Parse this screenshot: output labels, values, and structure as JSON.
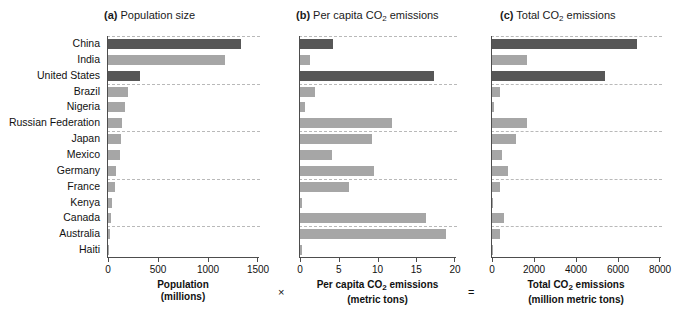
{
  "figure": {
    "operators": {
      "multiply": "×",
      "equals": "="
    }
  },
  "panels": [
    {
      "tag": "(a)",
      "title_text": "Population size",
      "title_html": "Population size",
      "caption_line1": "Population",
      "caption_line2": "(millions)",
      "ticks": [
        0,
        500,
        1000,
        1500
      ],
      "tick_labels": [
        "0",
        "500",
        "1000",
        "1500"
      ]
    },
    {
      "tag": "(b)",
      "title_text": "Per capita CO2 emissions",
      "caption_line1": "Per capita CO2 emissions",
      "caption_line2": "(metric tons)",
      "ticks": [
        0,
        5,
        10,
        15,
        20
      ],
      "tick_labels": [
        "0",
        "5",
        "10",
        "15",
        "20"
      ]
    },
    {
      "tag": "(c)",
      "title_text": "Total CO2 emissions",
      "caption_line1": "Total CO2 emissions",
      "caption_line2": "(million metric tons)",
      "ticks": [
        0,
        2000,
        4000,
        6000,
        8000
      ],
      "tick_labels": [
        "0",
        "2000",
        "4000",
        "6000",
        "8000"
      ]
    }
  ],
  "colors": {
    "bar_light": "#a6a6a6",
    "bar_dark": "#575757",
    "axis": "#4d4d4d",
    "gridline": "#b9b9b9",
    "background": "#ffffff",
    "text": "#111111"
  },
  "chart_data": {
    "type": "bar",
    "orientation": "horizontal",
    "categories": [
      "China",
      "India",
      "United States",
      "Brazil",
      "Nigeria",
      "Russian Federation",
      "Japan",
      "Mexico",
      "Germany",
      "France",
      "Kenya",
      "Canada",
      "Australia",
      "Haiti"
    ],
    "highlighted": [
      "China",
      "United States"
    ],
    "grid": "horizontal-dashed-every-3-rows",
    "legend": "none",
    "panels": [
      {
        "key": "population",
        "tag": "(a)",
        "title": "Population size",
        "xlabel": "Population (millions)",
        "units": "millions",
        "xlim": [
          0,
          1500
        ],
        "xticks": [
          0,
          500,
          1000,
          1500
        ],
        "values": [
          1330,
          1170,
          320,
          200,
          170,
          143,
          128,
          118,
          82,
          65,
          40,
          34,
          22,
          10
        ]
      },
      {
        "key": "per_capita_co2",
        "tag": "(b)",
        "title": "Per capita CO2 emissions",
        "xlabel": "Per capita CO2 emissions (metric tons)",
        "units": "metric tons",
        "xlim": [
          0,
          20
        ],
        "xticks": [
          0,
          5,
          10,
          15,
          20
        ],
        "values": [
          4.3,
          1.3,
          17.3,
          1.9,
          0.7,
          11.9,
          9.3,
          4.1,
          9.5,
          6.3,
          0.3,
          16.2,
          18.8,
          0.2
        ]
      },
      {
        "key": "total_co2",
        "tag": "(c)",
        "title": "Total CO2 emissions",
        "xlabel": "Total CO2 emissions (million metric tons)",
        "units": "million metric tons",
        "xlim": [
          0,
          8000
        ],
        "xticks": [
          0,
          2000,
          4000,
          6000,
          8000
        ],
        "values": [
          6900,
          1650,
          5400,
          400,
          80,
          1650,
          1150,
          480,
          760,
          380,
          12,
          550,
          400,
          2
        ]
      }
    ]
  }
}
